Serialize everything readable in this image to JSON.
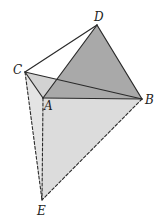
{
  "diagram": {
    "type": "3d-geometry-figure",
    "points": {
      "A": {
        "label": "A",
        "x": 43,
        "y": 98,
        "lx": 44,
        "ly": 110
      },
      "B": {
        "label": "B",
        "x": 142,
        "y": 99,
        "lx": 145,
        "ly": 104
      },
      "C": {
        "label": "C",
        "x": 25,
        "y": 72,
        "lx": 13,
        "ly": 74
      },
      "D": {
        "label": "D",
        "x": 97,
        "y": 25,
        "lx": 94,
        "ly": 21
      },
      "E": {
        "label": "E",
        "x": 42,
        "y": 200,
        "lx": 37,
        "ly": 215
      }
    },
    "solid_edges": [
      [
        "C",
        "D"
      ],
      [
        "C",
        "B"
      ],
      [
        "C",
        "A"
      ],
      [
        "A",
        "D"
      ],
      [
        "D",
        "B"
      ],
      [
        "A",
        "B"
      ]
    ],
    "dashed_edges": [
      [
        "C",
        "E"
      ],
      [
        "A",
        "E"
      ],
      [
        "B",
        "E"
      ]
    ],
    "faces": [
      {
        "name": "face-abe",
        "points": [
          "A",
          "B",
          "E"
        ],
        "fill": "#dcdcdc"
      },
      {
        "name": "face-cae",
        "points": [
          "C",
          "A",
          "E"
        ],
        "fill": "#e4e4e4"
      },
      {
        "name": "face-cab",
        "points": [
          "C",
          "A",
          "B"
        ],
        "fill": "#d2d2d2"
      },
      {
        "name": "face-abd",
        "points": [
          "A",
          "B",
          "D"
        ],
        "fill": "#a9a9a9"
      }
    ],
    "colors": {
      "line": "#2a2a2a",
      "background": "#ffffff"
    }
  }
}
